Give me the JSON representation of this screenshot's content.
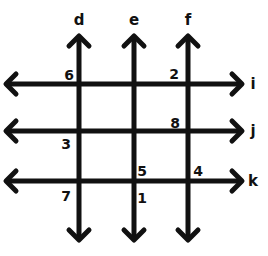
{
  "diagram": {
    "colors": {
      "line": "#111111",
      "background": "#ffffff"
    },
    "vertical_lines": [
      {
        "id": "d",
        "label": "d",
        "x": 79
      },
      {
        "id": "e",
        "label": "e",
        "x": 134
      },
      {
        "id": "f",
        "label": "f",
        "x": 188
      }
    ],
    "horizontal_lines": [
      {
        "id": "i",
        "label": "i",
        "y": 84
      },
      {
        "id": "j",
        "label": "j",
        "y": 131
      },
      {
        "id": "k",
        "label": "k",
        "y": 181
      }
    ],
    "numbers": [
      {
        "value": "6",
        "near": "d-i",
        "position": "upper-left",
        "x": 69,
        "y": 75
      },
      {
        "value": "2",
        "near": "f-i",
        "position": "upper-left",
        "x": 174,
        "y": 74
      },
      {
        "value": "8",
        "near": "f-j",
        "position": "upper-left",
        "x": 175,
        "y": 123
      },
      {
        "value": "3",
        "near": "d-j",
        "position": "lower-left",
        "x": 66,
        "y": 144
      },
      {
        "value": "5",
        "near": "e-k",
        "position": "upper-right",
        "x": 142,
        "y": 171
      },
      {
        "value": "4",
        "near": "f-k",
        "position": "upper-right",
        "x": 198,
        "y": 171
      },
      {
        "value": "7",
        "near": "d-k",
        "position": "lower-left",
        "x": 66,
        "y": 196
      },
      {
        "value": "1",
        "near": "e-k",
        "position": "lower-right",
        "x": 142,
        "y": 198
      }
    ]
  }
}
